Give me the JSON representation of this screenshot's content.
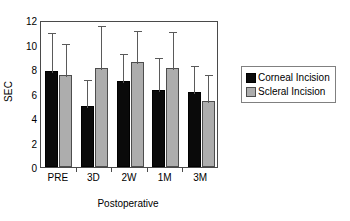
{
  "chart_data": {
    "type": "bar",
    "title": "",
    "xlabel": "Postoperative",
    "ylabel": "SEC",
    "categories": [
      "PRE",
      "3D",
      "2W",
      "1M",
      "3M"
    ],
    "ylim": [
      0,
      12
    ],
    "yticks": [
      0,
      2,
      4,
      6,
      8,
      10,
      12
    ],
    "grid": false,
    "legend_position": "right",
    "error_bars": "upper-only",
    "series": [
      {
        "name": "Corneal Incision",
        "color": "#0a0a0a",
        "values": [
          7.8,
          5.0,
          7.0,
          6.3,
          6.1
        ],
        "error_upper": [
          3.3,
          2.3,
          2.4,
          2.8,
          2.3
        ],
        "error_top": [
          11.1,
          7.3,
          9.4,
          9.1,
          8.4
        ]
      },
      {
        "name": "Scleral Incision",
        "color": "#adadad",
        "values": [
          7.55,
          8.1,
          8.6,
          8.1,
          5.4
        ],
        "error_upper": [
          2.65,
          3.6,
          2.7,
          3.1,
          2.3
        ],
        "error_top": [
          10.2,
          11.7,
          11.3,
          11.2,
          7.7
        ]
      }
    ]
  },
  "axes": {
    "y_label": "SEC",
    "x_label": "Postoperative",
    "y_tick_labels": [
      "0",
      "2",
      "4",
      "6",
      "8",
      "10",
      "12"
    ],
    "x_tick_labels": [
      "PRE",
      "3D",
      "2W",
      "1M",
      "3M"
    ]
  },
  "legend": {
    "items": [
      {
        "label": "Corneal Incision",
        "swatch": "corneal"
      },
      {
        "label": "Scleral Incision",
        "swatch": "scleral"
      }
    ]
  }
}
